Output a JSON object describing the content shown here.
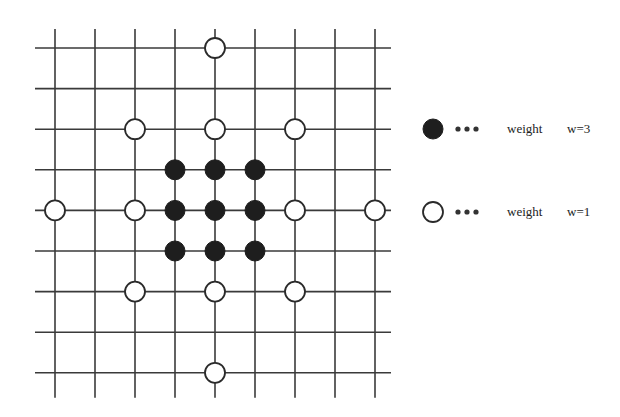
{
  "diagram": {
    "title": "",
    "grid": {
      "columns": 9,
      "rows": 9
    },
    "nodes": [
      {
        "col": 4,
        "row": 0,
        "weight": 1
      },
      {
        "col": 2,
        "row": 2,
        "weight": 1
      },
      {
        "col": 4,
        "row": 2,
        "weight": 1
      },
      {
        "col": 6,
        "row": 2,
        "weight": 1
      },
      {
        "col": 3,
        "row": 3,
        "weight": 3
      },
      {
        "col": 4,
        "row": 3,
        "weight": 3
      },
      {
        "col": 5,
        "row": 3,
        "weight": 3
      },
      {
        "col": 0,
        "row": 4,
        "weight": 1
      },
      {
        "col": 2,
        "row": 4,
        "weight": 1
      },
      {
        "col": 3,
        "row": 4,
        "weight": 3
      },
      {
        "col": 4,
        "row": 4,
        "weight": 3
      },
      {
        "col": 5,
        "row": 4,
        "weight": 3
      },
      {
        "col": 6,
        "row": 4,
        "weight": 1
      },
      {
        "col": 8,
        "row": 4,
        "weight": 1
      },
      {
        "col": 3,
        "row": 5,
        "weight": 3
      },
      {
        "col": 4,
        "row": 5,
        "weight": 3
      },
      {
        "col": 5,
        "row": 5,
        "weight": 3
      },
      {
        "col": 2,
        "row": 6,
        "weight": 1
      },
      {
        "col": 4,
        "row": 6,
        "weight": 1
      },
      {
        "col": 6,
        "row": 6,
        "weight": 1
      },
      {
        "col": 4,
        "row": 8,
        "weight": 1
      }
    ],
    "legend": [
      {
        "symbol": "filled-circle",
        "label": "weight",
        "value": "w=3"
      },
      {
        "symbol": "open-circle",
        "label": "weight",
        "value": "w=1"
      }
    ]
  }
}
